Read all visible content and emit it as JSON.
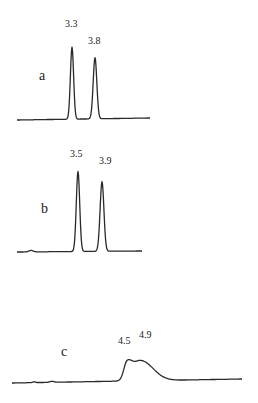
{
  "chart_data": {
    "type": "line",
    "title": "",
    "xlabel": "",
    "ylabel": "",
    "grid": false,
    "legend": "none",
    "series": [
      {
        "name": "a",
        "peaks": [
          {
            "label": "3.3",
            "position": 3.3,
            "relative_height": 1.0,
            "width": "narrow"
          },
          {
            "label": "3.8",
            "position": 3.8,
            "relative_height": 0.85,
            "width": "narrow"
          }
        ]
      },
      {
        "name": "b",
        "peaks": [
          {
            "label": "3.5",
            "position": 3.5,
            "relative_height": 1.0,
            "width": "narrow"
          },
          {
            "label": "3.9",
            "position": 3.9,
            "relative_height": 0.87,
            "width": "narrow"
          }
        ]
      },
      {
        "name": "c",
        "peaks": [
          {
            "label": "4.5",
            "position": 4.5,
            "relative_height": 0.85,
            "width": "broad"
          },
          {
            "label": "4.9",
            "position": 4.9,
            "relative_height": 1.0,
            "width": "broad"
          }
        ]
      }
    ]
  }
}
